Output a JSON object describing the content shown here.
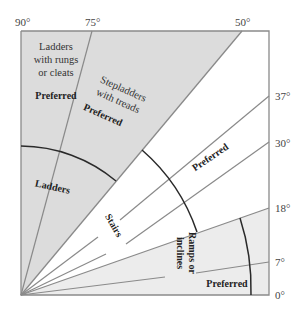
{
  "diagram": {
    "type": "angle-range-chart",
    "angle_labels": {
      "a90": "90°",
      "a75": "75°",
      "a50": "50°",
      "a37": "37°",
      "a30": "30°",
      "a18": "18°",
      "a7": "7°",
      "a0": "0°"
    },
    "regions": {
      "ladders_rungs": {
        "line1": "Ladders",
        "line2": "with rungs",
        "line3": "or cleats",
        "preferred": "Preferred",
        "range": "75°–90°"
      },
      "stepladders": {
        "line1": "Stepladders",
        "line2": "with treads",
        "preferred": "Preferred",
        "range": "50°–75°"
      },
      "ladders": {
        "label": "Ladders",
        "range": "50°–90°"
      },
      "stairs": {
        "label": "Stairs",
        "preferred": "Preferred",
        "range": "18°–50°",
        "preferred_range": "30°–37°"
      },
      "ramps": {
        "line1": "Ramps or",
        "line2": "inclines",
        "preferred": "Preferred",
        "range": "0°–18°",
        "preferred_range": "0°–7°"
      }
    },
    "colors": {
      "shaded": "#dcdcdc",
      "ramp_shade": "#ececec",
      "line": "#8a8a8a",
      "arc": "#2a2a2a",
      "text": "#333333"
    }
  }
}
